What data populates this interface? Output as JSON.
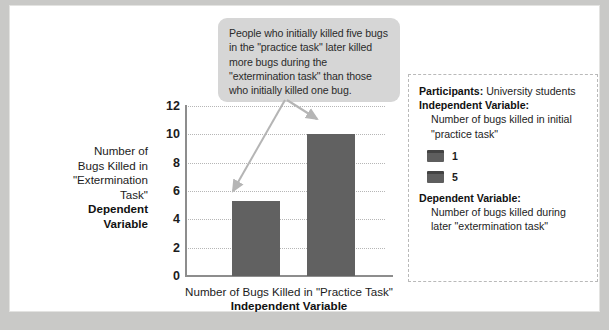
{
  "callout": {
    "text": "People who initially killed five bugs in the \"practice task\" later killed more bugs during the \"extermination task\" than those who initially killed one bug."
  },
  "chart_data": {
    "type": "bar",
    "title": "",
    "categories": [
      "1",
      "5"
    ],
    "values": [
      5.3,
      10
    ],
    "series": [
      {
        "name": "Number of bugs killed during later \"extermination task\"",
        "values": [
          5.3,
          10
        ]
      }
    ],
    "xlabel": "Number of Bugs Killed in \"Practice Task\"",
    "xlabel_sub": "Independent Variable",
    "ylabel": "Number of\nBugs Killed in\n\"Extermination\nTask\"",
    "ylabel_sub": "Dependent\nVariable",
    "ylim": [
      0,
      12
    ],
    "yticks": [
      "12",
      "10",
      "8",
      "6",
      "4",
      "2",
      "0"
    ],
    "ytick_values": [
      12,
      10,
      8,
      6,
      4,
      2,
      0
    ],
    "grid": true,
    "legend_position": "right",
    "bar_color": "#616161",
    "gridline_color": "#b6b6b6",
    "axis_color": "#8d8d8d"
  },
  "info_panel": {
    "participants_label": "Participants:",
    "participants_value": "University students",
    "independent_variable_label": "Independent Variable:",
    "independent_variable_desc": "Number of bugs killed in initial\n\"practice task\"",
    "legend": [
      {
        "label": "1",
        "color": "#5e5e5e"
      },
      {
        "label": "5",
        "color": "#5e5e5e"
      }
    ],
    "dependent_variable_label": "Dependent Variable:",
    "dependent_variable_desc": "Number of bugs killed during\nlater \"extermination task\""
  }
}
